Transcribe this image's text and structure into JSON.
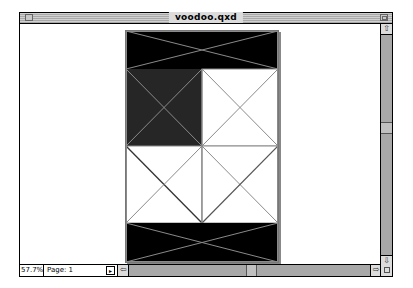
{
  "window": {
    "title": "voodoo.qxd"
  },
  "status": {
    "zoom": "57.7%",
    "page": "Page: 1"
  },
  "icons": {
    "close": "close-box-icon",
    "zoom": "zoom-box-icon",
    "up": "up-arrow-icon",
    "down": "down-arrow-icon",
    "left": "left-arrow-icon",
    "right": "right-arrow-icon",
    "grow": "grow-box-icon",
    "page_menu": "page-menu-icon"
  },
  "arrows": {
    "up": "⇧",
    "down": "⇩",
    "left": "⇦",
    "right": "⇨",
    "page": "▸"
  },
  "colors": {
    "black_box": "#000000",
    "dark_gray_box": "#262626",
    "frame_line": "#8a8a8a"
  }
}
